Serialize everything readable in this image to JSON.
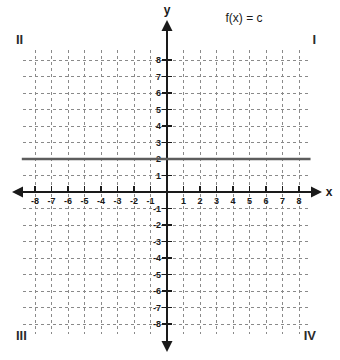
{
  "figure": {
    "title": "f(x) = c",
    "title_x": 244,
    "title_y": 22,
    "width": 340,
    "height": 360,
    "background": "#ffffff"
  },
  "axes": {
    "x_name": "x",
    "y_name": "y",
    "x_name_pos": {
      "x": 329,
      "y": 196
    },
    "y_name_pos": {
      "x": 167,
      "y": 14
    },
    "origin": {
      "x": 167,
      "y": 192
    },
    "unit_px": 16.5,
    "xlim": [
      -8,
      8
    ],
    "ylim": [
      -8,
      8
    ],
    "x_ticks": [
      -8,
      -7,
      -6,
      -5,
      -4,
      -3,
      -2,
      -1,
      1,
      2,
      3,
      4,
      5,
      6,
      7,
      8
    ],
    "y_ticks": [
      8,
      7,
      6,
      5,
      4,
      3,
      2,
      1,
      -1,
      -2,
      -3,
      -4,
      -5,
      -6,
      -7,
      -8
    ],
    "x_tick_labels": [
      "-8",
      "-7",
      "-6",
      "-5",
      "-4",
      "-3",
      "-2",
      "-1",
      "1",
      "2",
      "3",
      "4",
      "5",
      "6",
      "7",
      "8"
    ],
    "y_tick_labels": [
      "8",
      "7",
      "6",
      "5",
      "4",
      "3",
      "2",
      "1",
      "-1",
      "-2",
      "-3",
      "-4",
      "-5",
      "-6",
      "-7",
      "-8"
    ],
    "axis_color": "#1a1a1a",
    "grid_color": "#8a8a8a",
    "grid_on": true,
    "grid_dash": "3 3",
    "x_axis_span_px": [
      12,
      322
    ],
    "y_axis_span_px": [
      20,
      352
    ]
  },
  "quadrants": [
    {
      "label": "II",
      "x": 16,
      "y": 44,
      "anchor": "start"
    },
    {
      "label": "I",
      "x": 316,
      "y": 44,
      "anchor": "end"
    },
    {
      "label": "III",
      "x": 16,
      "y": 340,
      "anchor": "start"
    },
    {
      "label": "IV",
      "x": 316,
      "y": 340,
      "anchor": "end"
    }
  ],
  "chart_data": {
    "type": "line",
    "title": "f(x) = c",
    "xlabel": "x",
    "ylabel": "y",
    "xlim": [
      -8,
      8
    ],
    "ylim": [
      -8,
      8
    ],
    "grid": true,
    "legend": null,
    "series": [
      {
        "name": "f(x) = c",
        "description": "constant function, horizontal line",
        "constant_c": 2,
        "color": "#5d5d5d",
        "x": [
          -8.8,
          8.7
        ],
        "values": [
          2,
          2
        ]
      }
    ],
    "annotations": [
      {
        "text": "II",
        "role": "quadrant-label"
      },
      {
        "text": "I",
        "role": "quadrant-label"
      },
      {
        "text": "III",
        "role": "quadrant-label"
      },
      {
        "text": "IV",
        "role": "quadrant-label"
      }
    ]
  }
}
